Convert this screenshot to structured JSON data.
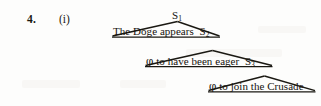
{
  "page": {
    "background_color": "#fdfdfc",
    "ink_color": "#15130e",
    "width": 321,
    "height": 106
  },
  "example": {
    "number_label": "4.",
    "roman_label": "(i)"
  },
  "tree": {
    "type": "nested-triangle-syntax-tree",
    "levels": [
      {
        "id": "level-1",
        "apex_node": "S",
        "apex_subscript": "1",
        "apex_label": "S1",
        "baseline_text": "The Doge appears",
        "embedded_node": "S",
        "embedded_subscript": "2",
        "embedded_label": "S2",
        "full_baseline": "The Doge appears S2"
      },
      {
        "id": "level-2",
        "apex_node": "S",
        "apex_subscript": "2",
        "apex_label": "S2",
        "baseline_text": "φ to have been eager",
        "embedded_node": "S",
        "embedded_subscript": "3",
        "embedded_label": "S3",
        "full_baseline": "φ to have been eager S3"
      },
      {
        "id": "level-3",
        "apex_node": "S",
        "apex_subscript": "3",
        "apex_label": "S3",
        "baseline_text": "φ to join the Crusade",
        "embedded_node": null,
        "embedded_subscript": null,
        "embedded_label": "",
        "full_baseline": "φ to join the Crusade"
      }
    ]
  },
  "strings": {
    "phi": "φ",
    "t1_words": "The Doge appears",
    "t2_words": "to have been eager",
    "t3_words": "to join the Crusade",
    "s1": "S",
    "s2": "S",
    "s3": "S",
    "sub1": "1",
    "sub2": "2",
    "sub3": "3"
  }
}
